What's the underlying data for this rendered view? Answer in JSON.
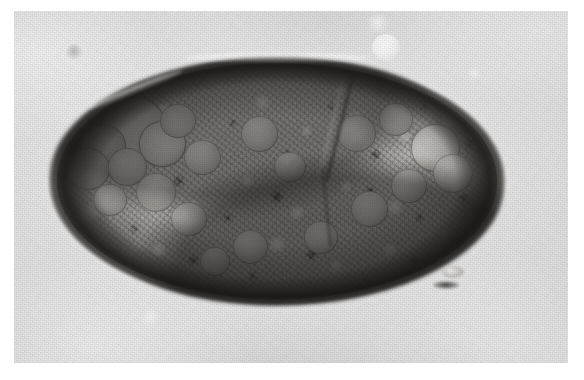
{
  "figure": {
    "domain": "micrograph",
    "kind": "light-microscopy photomicrograph",
    "caption": "",
    "color_mode": "grayscale",
    "has_scale_bar": false,
    "has_text_labels": false,
    "plate": {
      "background_color": "#ffffff",
      "field_color": "#e9e9e9",
      "border_visible": false,
      "left": 14,
      "top": 11,
      "width": 554,
      "height": 352
    }
  },
  "subject": {
    "name": "micro-organism",
    "description": "ellipsoidal thick-walled micro-organism (helminth egg / cyst) filled with dense granular contents",
    "outline_shape": "ellipse",
    "wall_color": "#221f1d",
    "cytoplasm_color": "#b9b7b4",
    "highlight_color": "#fbfaf8",
    "center_x": 277,
    "center_y": 181,
    "width": 458,
    "height": 250,
    "features": [
      {
        "label": "thick refractile wall",
        "position": "perimeter"
      },
      {
        "label": "granular cytoplasm",
        "position": "interior"
      },
      {
        "label": "refractile globules",
        "position": "left lobe"
      },
      {
        "label": "cleft / fission furrow",
        "position": "upper right"
      },
      {
        "label": "debris tag",
        "position": "lower right"
      }
    ],
    "globules": [
      {
        "cx": 17.5,
        "cy": 28.0,
        "r": 7.6,
        "soft": false
      },
      {
        "cx": 10.5,
        "cy": 35.0,
        "r": 5.2,
        "soft": true
      },
      {
        "cx": 24.0,
        "cy": 34.5,
        "r": 5.4,
        "soft": false
      },
      {
        "cx": 7.0,
        "cy": 45.0,
        "r": 5.0,
        "soft": true
      },
      {
        "cx": 16.0,
        "cy": 44.0,
        "r": 4.4,
        "soft": true
      },
      {
        "cx": 27.5,
        "cy": 24.5,
        "r": 4.0,
        "soft": true
      },
      {
        "cx": 33.0,
        "cy": 40.0,
        "r": 4.2,
        "soft": true
      },
      {
        "cx": 22.5,
        "cy": 55.0,
        "r": 4.6,
        "soft": true
      },
      {
        "cx": 12.0,
        "cy": 58.0,
        "r": 3.8,
        "soft": true
      },
      {
        "cx": 30.0,
        "cy": 66.0,
        "r": 4.0,
        "soft": true
      },
      {
        "cx": 46.0,
        "cy": 30.0,
        "r": 4.2,
        "soft": true
      },
      {
        "cx": 53.0,
        "cy": 44.0,
        "r": 3.6,
        "soft": true
      },
      {
        "cx": 68.0,
        "cy": 30.0,
        "r": 4.4,
        "soft": true
      },
      {
        "cx": 77.0,
        "cy": 24.0,
        "r": 3.8,
        "soft": true
      },
      {
        "cx": 86.0,
        "cy": 36.0,
        "r": 5.6,
        "soft": false
      },
      {
        "cx": 90.0,
        "cy": 47.0,
        "r": 4.6,
        "soft": true
      },
      {
        "cx": 80.0,
        "cy": 52.0,
        "r": 4.0,
        "soft": true
      },
      {
        "cx": 71.0,
        "cy": 62.0,
        "r": 4.2,
        "soft": true
      },
      {
        "cx": 60.0,
        "cy": 74.0,
        "r": 3.8,
        "soft": true
      },
      {
        "cx": 44.0,
        "cy": 78.0,
        "r": 4.0,
        "soft": true
      },
      {
        "cx": 36.0,
        "cy": 84.0,
        "r": 3.4,
        "soft": true
      }
    ]
  },
  "artifacts": [
    {
      "name": "bright-bubble-large",
      "cx": 386,
      "cy": 48,
      "r": 14,
      "tone": "bright"
    },
    {
      "name": "bright-bubble-small",
      "cx": 378,
      "cy": 24,
      "r": 10,
      "tone": "dim"
    },
    {
      "name": "faint-speck-upper-left",
      "cx": 74,
      "cy": 52,
      "r": 8,
      "tone": "dark"
    },
    {
      "name": "faint-speck-right",
      "cx": 474,
      "cy": 74,
      "r": 7,
      "tone": "dim"
    },
    {
      "name": "faint-speck-lower",
      "cx": 150,
      "cy": 318,
      "r": 9,
      "tone": "dim"
    }
  ]
}
